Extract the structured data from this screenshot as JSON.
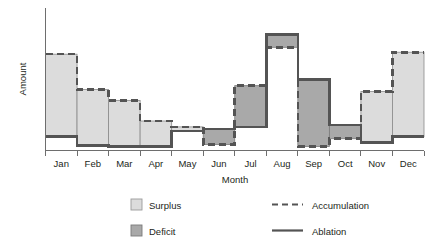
{
  "chart_data": {
    "type": "bar",
    "title": "",
    "xlabel": "Month",
    "ylabel": "Amount",
    "grid": false,
    "legend_position": "bottom",
    "categories": [
      "Jan",
      "Feb",
      "Mar",
      "Apr",
      "May",
      "Jun",
      "Jul",
      "Aug",
      "Sep",
      "Oct",
      "Nov",
      "Dec"
    ],
    "series": [
      {
        "name": "Accumulation",
        "style": "dashed-line",
        "values": [
          98,
          62,
          51,
          30,
          24,
          6,
          66,
          105,
          4,
          12,
          60,
          100
        ]
      },
      {
        "name": "Ablation",
        "style": "solid-line",
        "values": [
          14,
          5,
          4,
          4,
          20,
          22,
          24,
          118,
          72,
          26,
          8,
          14
        ]
      }
    ],
    "bars": [
      {
        "month": "Jan",
        "type": "Surplus",
        "top": 98,
        "bottom": 14
      },
      {
        "month": "Feb",
        "type": "Surplus",
        "top": 62,
        "bottom": 5
      },
      {
        "month": "Mar",
        "type": "Surplus",
        "top": 51,
        "bottom": 4
      },
      {
        "month": "Apr",
        "type": "Surplus",
        "top": 30,
        "bottom": 4
      },
      {
        "month": "May",
        "type": "Surplus",
        "top": 24,
        "bottom": 20
      },
      {
        "month": "Jun",
        "type": "Deficit",
        "top": 22,
        "bottom": 6
      },
      {
        "month": "Jul",
        "type": "Deficit",
        "top": 66,
        "bottom": 24
      },
      {
        "month": "Aug",
        "type": "Deficit",
        "top": 118,
        "bottom": 105
      },
      {
        "month": "Sep",
        "type": "Deficit",
        "top": 72,
        "bottom": 4
      },
      {
        "month": "Oct",
        "type": "Deficit",
        "top": 26,
        "bottom": 12
      },
      {
        "month": "Nov",
        "type": "Surplus",
        "top": 60,
        "bottom": 8
      },
      {
        "month": "Dec",
        "type": "Surplus",
        "top": 100,
        "bottom": 14
      }
    ],
    "ylim": [
      0,
      145
    ],
    "y_ticks_shown": false
  },
  "axes": {
    "x_title": "Month",
    "y_title": "Amount",
    "x_tick_labels": [
      "Jan",
      "Feb",
      "Mar",
      "Apr",
      "May",
      "Jun",
      "Jul",
      "Aug",
      "Sep",
      "Oct",
      "Nov",
      "Dec"
    ]
  },
  "legend": {
    "items": [
      {
        "label": "Surplus",
        "marker": "swatch-light"
      },
      {
        "label": "Deficit",
        "marker": "swatch-dark"
      },
      {
        "label": "Accumulation",
        "marker": "dashed-line"
      },
      {
        "label": "Ablation",
        "marker": "solid-line"
      }
    ]
  }
}
